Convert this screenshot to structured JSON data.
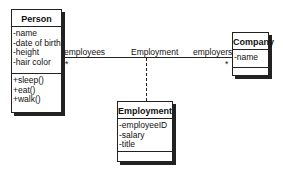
{
  "classes": {
    "person": {
      "name": "Person",
      "attributes": [
        "-name",
        "-date of birth",
        "-height",
        "-hair color"
      ],
      "methods": [
        "+sleep()",
        "+eat()",
        "+walk()"
      ]
    },
    "company": {
      "name": "Company",
      "attributes": [
        "-name"
      ],
      "methods": []
    },
    "employment": {
      "name": "Employment",
      "attributes": [
        "-employeeID",
        "-salary",
        "-title"
      ],
      "methods": []
    }
  },
  "association": {
    "name": "Employment",
    "left_role": "employees",
    "left_multiplicity": "*",
    "right_role": "employers",
    "right_multiplicity": "*"
  }
}
